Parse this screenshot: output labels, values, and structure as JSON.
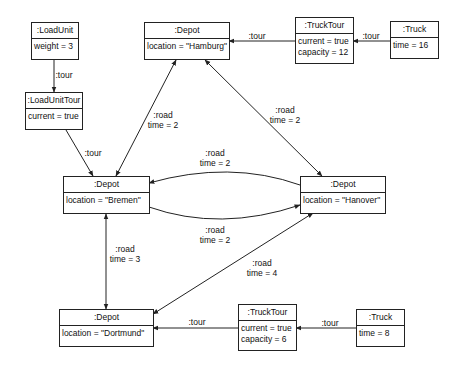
{
  "diagram": {
    "type": "uml-object-diagram",
    "objects": {
      "load_unit": {
        "title": ":LoadUnit",
        "attrs": [
          "weight = 3"
        ]
      },
      "load_unit_tour": {
        "title": ":LoadUnitTour",
        "attrs": [
          "current = true"
        ]
      },
      "depot_hamburg": {
        "title": ":Depot",
        "attrs": [
          "location = \"Hamburg\""
        ]
      },
      "truck_tour_top": {
        "title": ":TruckTour",
        "attrs": [
          "current = true",
          "capacity = 12"
        ]
      },
      "truck_top": {
        "title": ":Truck",
        "attrs": [
          "time = 16"
        ]
      },
      "depot_bremen": {
        "title": ":Depot",
        "attrs": [
          "location = \"Bremen\""
        ]
      },
      "depot_hanover": {
        "title": ":Depot",
        "attrs": [
          "location = \"Hanover\""
        ]
      },
      "depot_dortmund": {
        "title": ":Depot",
        "attrs": [
          "location = \"Dortmund\""
        ]
      },
      "truck_tour_bottom": {
        "title": ":TruckTour",
        "attrs": [
          "current = true",
          "capacity = 6"
        ]
      },
      "truck_bottom": {
        "title": ":Truck",
        "attrs": [
          "time = 8"
        ]
      }
    },
    "links": {
      "loadunit_to_loadunittour": {
        "name": ":tour"
      },
      "loadunittour_to_bremen": {
        "name": ":tour"
      },
      "trucktour_top_to_hamburg": {
        "name": ":tour"
      },
      "truck_top_to_trucktour_top": {
        "name": ":tour"
      },
      "hamburg_bremen": {
        "name": ":road",
        "value": "time = 2"
      },
      "hamburg_hanover": {
        "name": ":road",
        "value": "time = 2"
      },
      "bremen_hanover_upper": {
        "name": ":road",
        "value": "time = 2"
      },
      "hanover_bremen_lower": {
        "name": ":road",
        "value": "time = 2"
      },
      "bremen_dortmund": {
        "name": ":road",
        "value": "time = 3"
      },
      "dortmund_hanover": {
        "name": ":road",
        "value": "time = 4"
      },
      "trucktour_bottom_to_dortmund": {
        "name": ":tour"
      },
      "truck_bottom_to_trucktour_bottom": {
        "name": ":tour"
      }
    }
  },
  "colors": {
    "line": "#222222",
    "background": "#ffffff"
  }
}
